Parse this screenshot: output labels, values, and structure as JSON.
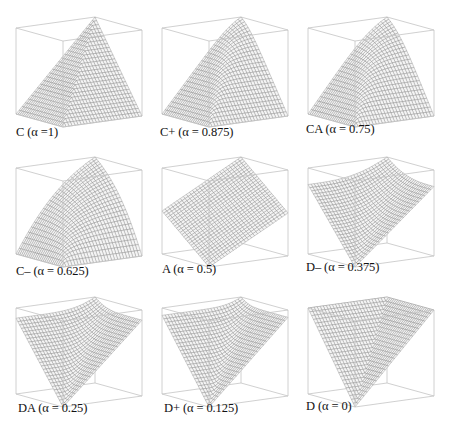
{
  "figure": {
    "title": "",
    "layout": {
      "rows": 3,
      "cols": 3
    },
    "colors": {
      "box": "#c4c4c4",
      "mesh": "#7a7a7a",
      "fill": "#f4f4f4",
      "text": "#111111"
    }
  },
  "panels": [
    {
      "name": "C",
      "alpha": 1,
      "label": "C (α =1)"
    },
    {
      "name": "C+",
      "alpha": 0.875,
      "label": "C+ (α = 0.875)"
    },
    {
      "name": "CA",
      "alpha": 0.75,
      "label": "CA (α = 0.75)"
    },
    {
      "name": "C-",
      "alpha": 0.625,
      "label": "C– (α = 0.625)"
    },
    {
      "name": "A",
      "alpha": 0.5,
      "label": "A (α = 0.5)"
    },
    {
      "name": "D-",
      "alpha": 0.375,
      "label": "D– (α = 0.375)"
    },
    {
      "name": "DA",
      "alpha": 0.25,
      "label": "DA (α = 0.25)"
    },
    {
      "name": "D+",
      "alpha": 0.125,
      "label": "D+ (α = 0.125)"
    },
    {
      "name": "D",
      "alpha": 0,
      "label": "D (α = 0)"
    }
  ],
  "chart_data": {
    "type": "surface-grid",
    "title": "",
    "xlabel": "",
    "ylabel": "",
    "zlabel": "",
    "xlim": [
      0,
      1
    ],
    "ylim": [
      0,
      1
    ],
    "zlim": [
      0,
      1
    ],
    "grid": false,
    "series": [
      {
        "name": "C",
        "alpha": 1,
        "shape": "min(x,y) — ridge peaking at back corner"
      },
      {
        "name": "C+",
        "alpha": 0.875,
        "shape": "strong partial conjunction"
      },
      {
        "name": "CA",
        "alpha": 0.75,
        "shape": "medium partial conjunction"
      },
      {
        "name": "C-",
        "alpha": 0.625,
        "shape": "weak partial conjunction"
      },
      {
        "name": "A",
        "alpha": 0.5,
        "shape": "arithmetic mean — flat tilted plane"
      },
      {
        "name": "D-",
        "alpha": 0.375,
        "shape": "weak partial disjunction"
      },
      {
        "name": "DA",
        "alpha": 0.25,
        "shape": "medium partial disjunction"
      },
      {
        "name": "D+",
        "alpha": 0.125,
        "shape": "strong partial disjunction"
      },
      {
        "name": "D",
        "alpha": 0,
        "shape": "max(x,y) — V shape with low point at front corner"
      }
    ]
  }
}
